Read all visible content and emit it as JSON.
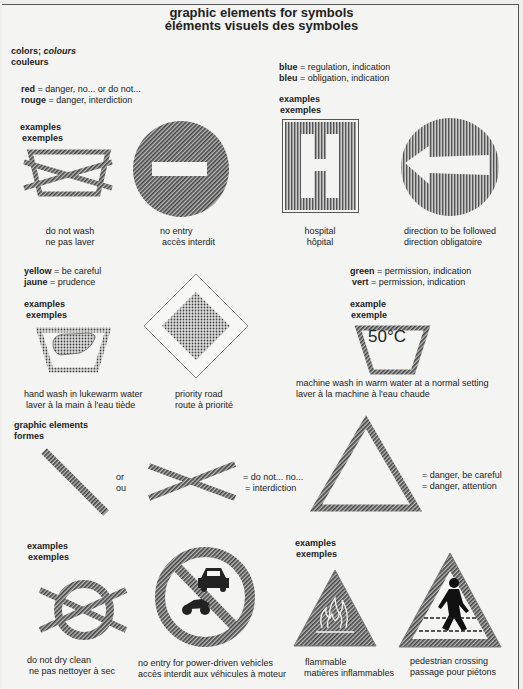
{
  "title": {
    "line1": "graphic elements for symbols",
    "line2": "éléments visuels des symboles"
  },
  "colors_heading": {
    "en_a": "colors;",
    "en_b": "colours",
    "fr": "couleurs"
  },
  "red": {
    "en_key": "red",
    "en_val": " = danger, no... or do not...",
    "fr_key": "rouge",
    "fr_val": " = danger, interdiction"
  },
  "blue": {
    "en_key": "blue",
    "en_val": " = regulation, indication",
    "fr_key": "bleu",
    "fr_val": " = obligation, indication"
  },
  "yellow": {
    "en_key": "yellow",
    "en_val": " = be careful",
    "fr_key": "jaune",
    "fr_val": " = prudence"
  },
  "green": {
    "en_key": "green",
    "en_val": " = permission, indication",
    "fr_key": "vert",
    "fr_val": " = permission, indication"
  },
  "examples": {
    "en": "examples",
    "fr": "exemples",
    "en_single": "example",
    "fr_single": "exemple"
  },
  "symbols": {
    "do_not_wash": {
      "en": "do not wash",
      "fr": "ne pas laver"
    },
    "no_entry": {
      "en": "no entry",
      "fr": "accès interdit"
    },
    "hospital": {
      "en": "hospital",
      "fr": "hôpital"
    },
    "direction": {
      "en": "direction to be followed",
      "fr": "direction obligatoire"
    },
    "hand_wash": {
      "en": "hand wash in lukewarm water",
      "fr": "laver à la main à l'eau tiède"
    },
    "priority_road": {
      "en": "priority road",
      "fr": "route à priorité"
    },
    "machine_wash": {
      "en": "machine wash in warm water at a normal setting",
      "fr": "laver à la machine à l'eau chaude",
      "temp": "50°C"
    },
    "do_not_dry_clean": {
      "en": "do not dry clean",
      "fr": "ne pas nettoyer à sec"
    },
    "no_vehicles": {
      "en": "no entry for power-driven vehicles",
      "fr": "accès interdit aux véhicules à moteur"
    },
    "flammable": {
      "en": "flammable",
      "fr": "matières inflammables"
    },
    "pedestrian": {
      "en": "pedestrian crossing",
      "fr": "passage pour piétons"
    }
  },
  "graphic_elements": {
    "heading_en": "graphic elements",
    "heading_fr": "formes",
    "or_en": "or",
    "or_fr": "ou",
    "cross_en": "= do not... no...",
    "cross_fr": "= interdiction",
    "triangle_en": "= danger, be careful",
    "triangle_fr": "= danger, attention"
  }
}
